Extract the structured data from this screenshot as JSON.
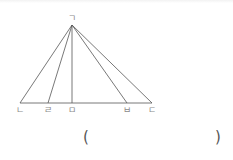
{
  "diagram": {
    "type": "triangle-with-cevians",
    "stroke_color": "#555555",
    "label_color": "#8a8a8a",
    "apex": {
      "label": "ㄱ",
      "x": 72,
      "y": 25
    },
    "base_y": 103,
    "base_points": [
      {
        "label": "ㄴ",
        "x": 20
      },
      {
        "label": "ㄹ",
        "x": 48
      },
      {
        "label": "ㅁ",
        "x": 72
      },
      {
        "label": "ㅂ",
        "x": 127
      },
      {
        "label": "ㄷ",
        "x": 152
      }
    ]
  },
  "answer": {
    "open_paren": "(",
    "close_paren": ")",
    "value": ""
  }
}
